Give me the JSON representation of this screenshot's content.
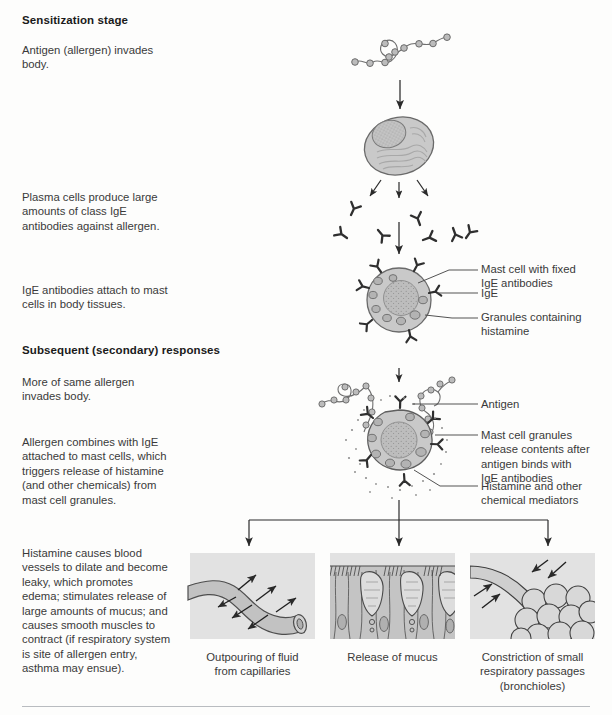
{
  "page": {
    "width": 612,
    "height": 715,
    "background": "#fdfdfc",
    "ink": "#3a3a3a",
    "cell_fill": "#c9c9c9",
    "panel_bg": "#e2e2e2",
    "rule_color": "#b9bcc0"
  },
  "sections": {
    "sensitization": {
      "heading": "Sensitization stage",
      "steps": [
        {
          "text": "Antigen (allergen) invades\nbody."
        },
        {
          "text": "Plasma cells produce large\namounts of class IgE\nantibodies against allergen."
        },
        {
          "text": "IgE antibodies attach to mast\ncells in body tissues."
        }
      ]
    },
    "subsequent": {
      "heading": "Subsequent (secondary) responses",
      "steps": [
        {
          "text": "More of same allergen\ninvades body."
        },
        {
          "text": "Allergen combines with IgE\nattached to mast cells, which\ntriggers release of histamine\n(and other chemicals) from\nmast cell granules."
        },
        {
          "text": "Histamine causes blood\nvessels to dilate and become\nleaky, which promotes\nedema; stimulates release of\nlarge amounts of mucus; and\ncauses smooth muscles to\ncontract (if respiratory system\nis site of allergen entry,\nasthma may ensue)."
        }
      ]
    }
  },
  "callouts": [
    {
      "id": "mast-cell-fixed",
      "text": "Mast cell with fixed\nIgE antibodies"
    },
    {
      "id": "ige",
      "text": "IgE"
    },
    {
      "id": "granules",
      "text": "Granules containing\nhistamine"
    },
    {
      "id": "antigen",
      "text": "Antigen"
    },
    {
      "id": "granule-release",
      "text": "Mast cell granules\nrelease contents after\nantigen binds with\nIgE antibodies"
    },
    {
      "id": "histamine-mediators",
      "text": "Histamine and other\nchemical mediators"
    }
  ],
  "panels": [
    {
      "id": "capillary",
      "caption": "Outpouring of fluid\nfrom capillaries",
      "icon": "capillary-vessel-icon"
    },
    {
      "id": "mucus",
      "caption": "Release of mucus",
      "icon": "mucosal-epithelium-icon"
    },
    {
      "id": "bronchiole",
      "caption": "Constriction of small\nrespiratory passages\n(bronchioles)",
      "icon": "bronchiole-alveoli-icon"
    }
  ],
  "figures": {
    "antigen_chain_top": "antigen-chain-icon",
    "plasma_cell": "plasma-cell-icon",
    "antibody_cluster": "antibody-cluster-icon",
    "mast_cell_sensitized": "mast-cell-icon",
    "mast_cell_degranulating": "degranulating-mast-cell-icon"
  }
}
